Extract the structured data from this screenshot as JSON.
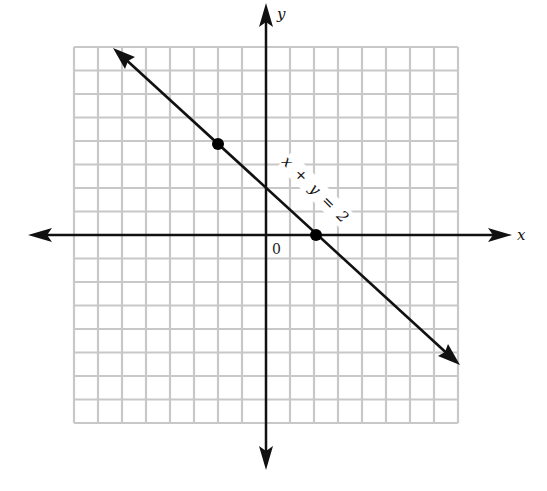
{
  "chart_data": {
    "type": "line",
    "title": "",
    "equation": "x + y = 2",
    "xlabel": "x",
    "ylabel": "y",
    "origin_label": "0",
    "xlim": [
      -8,
      8
    ],
    "ylim": [
      -8,
      8
    ],
    "grid": true,
    "grid_step": 1,
    "series": [
      {
        "name": "x + y = 2",
        "kind": "line_with_arrows",
        "points": [
          {
            "x": -2,
            "y": 4
          },
          {
            "x": 2,
            "y": 0
          }
        ],
        "marked_points": [
          {
            "x": -2,
            "y": 4
          },
          {
            "x": 2,
            "y": 0
          }
        ]
      }
    ]
  },
  "labels": {
    "x_axis": "x",
    "y_axis": "y",
    "origin": "0",
    "line": "x + y = 2"
  },
  "colors": {
    "grid": "#c8c8c8",
    "axes": "#111111",
    "line": "#111111",
    "points": "#000000"
  }
}
